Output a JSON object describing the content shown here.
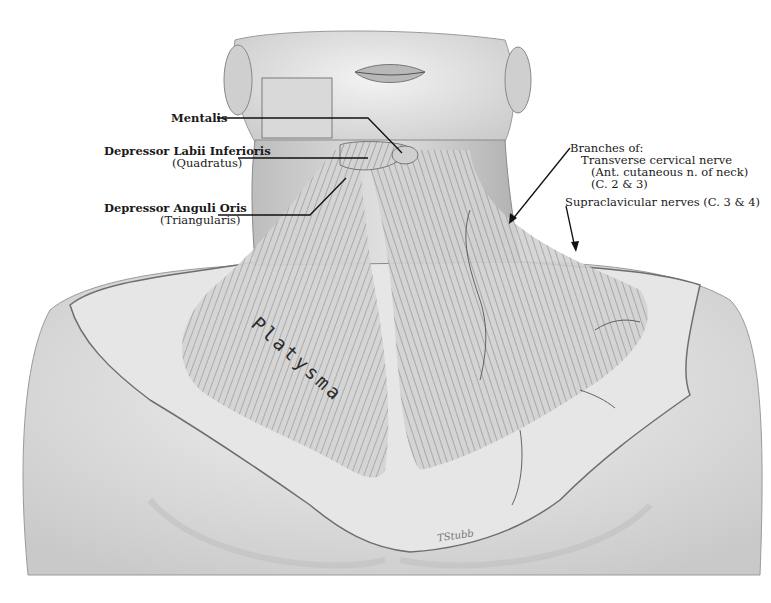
{
  "figure": {
    "muscle_label": "Platysma",
    "signature": "TStubb"
  },
  "labels": {
    "mentalis": "Mentalis",
    "depressor_labii_line1": "Depressor Labii Inferioris",
    "depressor_labii_line2": "(Quadratus)",
    "depressor_anguli_line1": "Depressor Anguli Oris",
    "depressor_anguli_line2": "(Triangularis)",
    "branches_of": "Branches of:",
    "transverse_cervical": "Transverse cervical nerve",
    "ant_cutaneous": "(Ant. cutaneous n. of neck)",
    "c2_c3": "(C. 2 & 3)",
    "supraclavicular": "Supraclavicular nerves (C. 3 & 4)"
  },
  "colors": {
    "background": "#ffffff",
    "ink": "#1a1a1a",
    "skin_light": "#ececec",
    "skin_shade": "#bdbdbd",
    "muscle": "#9a9a9a"
  }
}
